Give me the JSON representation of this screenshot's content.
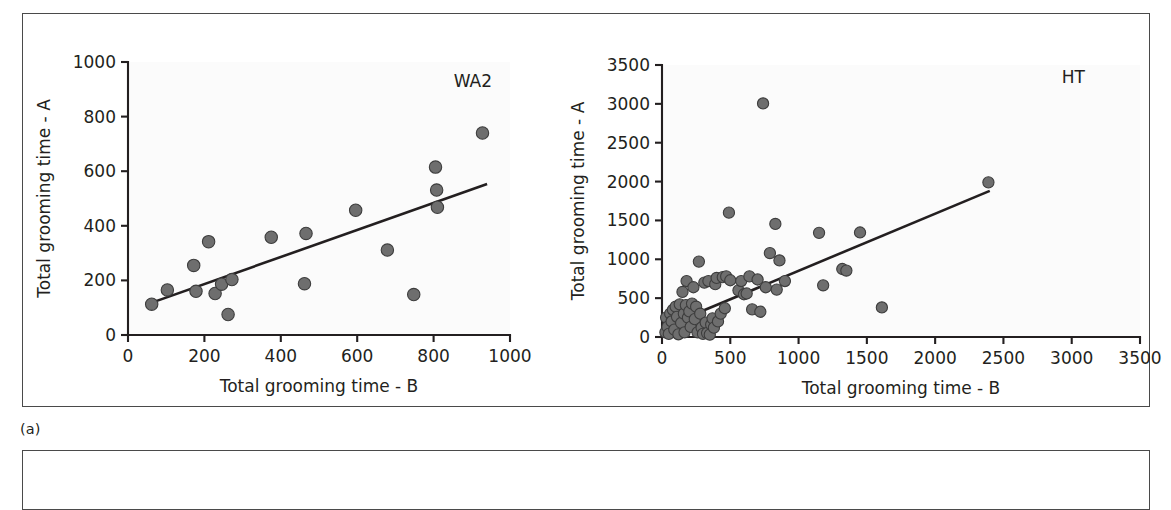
{
  "figure": {
    "caption": "(a)",
    "panel_border_color": "#4a4a4a",
    "marker_fill": "#6e6e6e",
    "marker_stroke": "#3d3d3d",
    "line_color": "#231f20",
    "plot_background": "#fbfbfb"
  },
  "chart_data": [
    {
      "type": "scatter",
      "title": "WA2",
      "xlabel": "Total grooming time - B",
      "ylabel": "Total grooming time - A",
      "xlim": [
        0,
        1000
      ],
      "ylim": [
        0,
        1000
      ],
      "xticks": [
        0,
        200,
        400,
        600,
        800,
        1000
      ],
      "yticks": [
        0,
        200,
        400,
        600,
        800,
        1000
      ],
      "xtick_labels": [
        "0",
        "200",
        "400",
        "600",
        "800",
        "1000"
      ],
      "ytick_labels": [
        "0",
        "200",
        "400",
        "600",
        "800",
        "1000"
      ],
      "grid": false,
      "legend": "none",
      "points": [
        [
          62,
          113
        ],
        [
          103,
          165
        ],
        [
          172,
          255
        ],
        [
          178,
          160
        ],
        [
          211,
          342
        ],
        [
          228,
          152
        ],
        [
          245,
          186
        ],
        [
          262,
          75
        ],
        [
          272,
          203
        ],
        [
          375,
          358
        ],
        [
          462,
          188
        ],
        [
          466,
          372
        ],
        [
          596,
          457
        ],
        [
          679,
          311
        ],
        [
          748,
          148
        ],
        [
          805,
          615
        ],
        [
          808,
          531
        ],
        [
          810,
          468
        ],
        [
          928,
          740
        ]
      ],
      "fit_line": {
        "x0": 55,
        "y0": 115,
        "x1": 940,
        "y1": 553
      }
    },
    {
      "type": "scatter",
      "title": "HT",
      "xlabel": "Total grooming time - B",
      "ylabel": "Total grooming time - A",
      "xlim": [
        0,
        3500
      ],
      "ylim": [
        0,
        3500
      ],
      "xticks": [
        0,
        500,
        1000,
        1500,
        2000,
        2500,
        3000,
        3500
      ],
      "yticks": [
        0,
        500,
        1000,
        1500,
        2000,
        2500,
        3000,
        3500
      ],
      "xtick_labels": [
        "0",
        "500",
        "1000",
        "1500",
        "2000",
        "2500",
        "3000",
        "3500"
      ],
      "ytick_labels": [
        "0",
        "500",
        "1000",
        "1500",
        "2000",
        "2500",
        "3000",
        "3500"
      ],
      "grid": false,
      "legend": "none",
      "points": [
        [
          25,
          60
        ],
        [
          30,
          250
        ],
        [
          40,
          130
        ],
        [
          50,
          40
        ],
        [
          60,
          300
        ],
        [
          70,
          200
        ],
        [
          80,
          350
        ],
        [
          90,
          95
        ],
        [
          100,
          390
        ],
        [
          110,
          260
        ],
        [
          120,
          35
        ],
        [
          130,
          420
        ],
        [
          140,
          180
        ],
        [
          150,
          580
        ],
        [
          160,
          300
        ],
        [
          165,
          60
        ],
        [
          175,
          410
        ],
        [
          180,
          720
        ],
        [
          190,
          250
        ],
        [
          200,
          330
        ],
        [
          210,
          130
        ],
        [
          220,
          430
        ],
        [
          230,
          640
        ],
        [
          240,
          230
        ],
        [
          250,
          390
        ],
        [
          260,
          60
        ],
        [
          270,
          970
        ],
        [
          280,
          300
        ],
        [
          290,
          120
        ],
        [
          300,
          40
        ],
        [
          310,
          700
        ],
        [
          320,
          185
        ],
        [
          330,
          50
        ],
        [
          340,
          720
        ],
        [
          350,
          30
        ],
        [
          360,
          160
        ],
        [
          370,
          240
        ],
        [
          380,
          120
        ],
        [
          390,
          680
        ],
        [
          400,
          760
        ],
        [
          410,
          200
        ],
        [
          430,
          300
        ],
        [
          445,
          770
        ],
        [
          460,
          370
        ],
        [
          470,
          780
        ],
        [
          490,
          1600
        ],
        [
          500,
          730
        ],
        [
          560,
          600
        ],
        [
          580,
          720
        ],
        [
          600,
          550
        ],
        [
          620,
          560
        ],
        [
          640,
          780
        ],
        [
          660,
          355
        ],
        [
          700,
          740
        ],
        [
          720,
          325
        ],
        [
          740,
          3005
        ],
        [
          760,
          640
        ],
        [
          790,
          1080
        ],
        [
          830,
          1455
        ],
        [
          840,
          610
        ],
        [
          860,
          985
        ],
        [
          900,
          720
        ],
        [
          1150,
          1340
        ],
        [
          1180,
          665
        ],
        [
          1320,
          875
        ],
        [
          1350,
          855
        ],
        [
          1450,
          1345
        ],
        [
          1610,
          380
        ],
        [
          2390,
          1990
        ]
      ],
      "fit_line": {
        "x0": 180,
        "y0": 250,
        "x1": 2400,
        "y1": 1880
      }
    }
  ]
}
